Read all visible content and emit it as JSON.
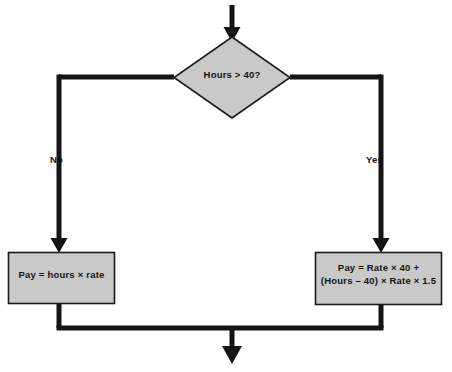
{
  "diagram": {
    "colors": {
      "node_fill": "#c9c9c9",
      "node_stroke": "#1a1a1a",
      "connector": "#141414",
      "background": "#ffffff",
      "text": "#141414"
    },
    "nodes": {
      "decision": {
        "shape": "diamond",
        "text": "Hours > 40?"
      },
      "process_left": {
        "shape": "rectangle",
        "text": "Pay = hours × rate"
      },
      "process_right": {
        "shape": "rectangle",
        "text": "Pay = Rate × 40 +\n(Hours – 40) × Rate × 1.5"
      }
    },
    "branches": {
      "no_label": "No",
      "yes_label": "Yes"
    },
    "connectors": {
      "entry": "arrow-down-into-decision",
      "false_path": "decision-left-to-process-left",
      "true_path": "decision-right-to-process-right",
      "merge": "both-processes-down-to-exit",
      "exit": "arrow-down-out"
    }
  }
}
